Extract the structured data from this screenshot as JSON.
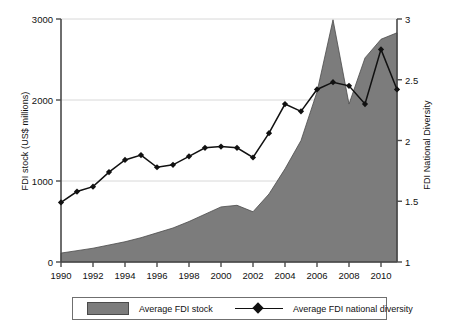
{
  "chart_data": {
    "type": "area",
    "title": "",
    "subtitle": "",
    "xlabel": "",
    "ylabel": "FDI stock (US$ millions)",
    "y2label": "FDI National Diversity",
    "grid": true,
    "legend_position": "bottom",
    "xlim": [
      1990,
      2011
    ],
    "ylim": [
      0,
      3000
    ],
    "y2lim": [
      1,
      3
    ],
    "x_ticks": [
      1990,
      1992,
      1994,
      1996,
      1998,
      2000,
      2002,
      2004,
      2006,
      2008,
      2010
    ],
    "x_tick_labels": [
      "1990",
      "1992",
      "1994",
      "1996",
      "1998",
      "2000",
      "2002",
      "2004",
      "2006",
      "2008",
      "2010"
    ],
    "y_ticks": [
      0,
      1000,
      2000,
      3000
    ],
    "y_tick_labels": [
      "0",
      "1000",
      "2000",
      "3000"
    ],
    "y2_ticks": [
      1,
      1.5,
      2,
      2.5,
      3
    ],
    "y2_tick_labels": [
      "1",
      "1.5",
      "2",
      "2.5",
      "3"
    ],
    "x": [
      1990,
      1991,
      1992,
      1993,
      1994,
      1995,
      1996,
      1997,
      1998,
      1999,
      2000,
      2001,
      2002,
      2003,
      2004,
      2005,
      2006,
      2007,
      2008,
      2009,
      2010,
      2011
    ],
    "series": [
      {
        "name": "Average FDI stock",
        "kind": "area",
        "axis": "left",
        "color": "#7c7c7c",
        "edge_color": "#4a4a4a",
        "values": [
          110,
          140,
          170,
          210,
          250,
          300,
          360,
          420,
          500,
          590,
          680,
          700,
          620,
          840,
          1150,
          1500,
          2100,
          2990,
          1950,
          2520,
          2750,
          2830
        ]
      },
      {
        "name": "Average FDI national diversity",
        "kind": "line",
        "axis": "right",
        "color": "#111111",
        "marker": "diamond",
        "values": [
          1.49,
          1.58,
          1.62,
          1.74,
          1.84,
          1.88,
          1.78,
          1.8,
          1.87,
          1.94,
          1.95,
          1.94,
          1.86,
          2.06,
          2.3,
          2.24,
          2.42,
          2.48,
          2.45,
          2.3,
          2.75,
          2.42
        ]
      }
    ]
  },
  "axes": {
    "y_left_title": "FDI stock (US$ millions)",
    "y_right_title": "FDI National Diversity"
  },
  "legend": {
    "area_label": "Average FDI stock",
    "line_label": "Average FDI national diversity"
  }
}
